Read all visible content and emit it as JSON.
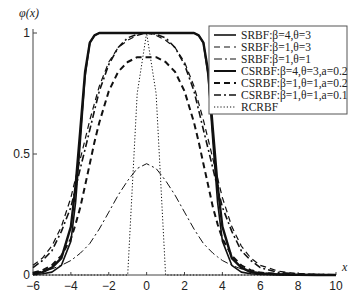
{
  "chart_data": {
    "type": "line",
    "title": "",
    "xlabel": "x",
    "ylabel": "φ(x)",
    "xlim": [
      -6,
      10
    ],
    "ylim": [
      0,
      1
    ],
    "xticks": [
      -6,
      -4,
      -2,
      0,
      2,
      4,
      6,
      8,
      10
    ],
    "xtick_labels": [
      "−6",
      "−4",
      "−2",
      "0",
      "2",
      "4",
      "6",
      "8",
      "10"
    ],
    "yticks": [
      0,
      0.5,
      1
    ],
    "ytick_labels": [
      "0",
      "0.5",
      "1"
    ],
    "grid": false,
    "legend_position": "upper right",
    "x": [
      -6,
      -5.5,
      -5,
      -4.5,
      -4,
      -3.75,
      -3.5,
      -3.25,
      -3,
      -2.75,
      -2.5,
      -2,
      -1.5,
      -1,
      -0.5,
      0,
      0.5,
      1,
      1.5,
      2,
      2.5,
      2.75,
      3,
      3.25,
      3.5,
      3.75,
      4,
      4.5,
      5,
      5.5,
      6,
      7,
      8,
      9,
      10
    ],
    "series": [
      {
        "name": "SRBF:β=4,θ=3",
        "style": "solid",
        "width": 1.6,
        "values": [
          0.002,
          0.005,
          0.012,
          0.04,
          0.14,
          0.3,
          0.55,
          0.82,
          0.96,
          0.99,
          1,
          1,
          1,
          1,
          1,
          1,
          1,
          1,
          1,
          1,
          1,
          0.99,
          0.96,
          0.82,
          0.55,
          0.3,
          0.14,
          0.04,
          0.012,
          0.005,
          0.002,
          0.001,
          0,
          0,
          0
        ]
      },
      {
        "name": "SRBF:β=1,θ=3",
        "style": "dashed",
        "width": 1.2,
        "values": [
          0.04,
          0.07,
          0.12,
          0.2,
          0.32,
          0.4,
          0.48,
          0.56,
          0.64,
          0.71,
          0.78,
          0.88,
          0.94,
          0.97,
          0.99,
          1,
          0.99,
          0.97,
          0.94,
          0.88,
          0.78,
          0.71,
          0.64,
          0.56,
          0.48,
          0.4,
          0.32,
          0.2,
          0.12,
          0.07,
          0.04,
          0.015,
          0.005,
          0.002,
          0.001
        ]
      },
      {
        "name": "SRBF:β=1,θ=1",
        "style": "dashdot",
        "width": 1.0,
        "values": [
          0.01,
          0.015,
          0.025,
          0.04,
          0.06,
          0.075,
          0.09,
          0.11,
          0.13,
          0.16,
          0.19,
          0.26,
          0.33,
          0.39,
          0.44,
          0.46,
          0.44,
          0.39,
          0.33,
          0.26,
          0.19,
          0.16,
          0.13,
          0.11,
          0.09,
          0.075,
          0.06,
          0.04,
          0.025,
          0.015,
          0.01,
          0.004,
          0.002,
          0.001,
          0
        ]
      },
      {
        "name": "CSRBF:β=4,θ=3,a=0.2",
        "style": "solid",
        "width": 2.4,
        "values": [
          0.006,
          0.012,
          0.03,
          0.07,
          0.2,
          0.37,
          0.6,
          0.84,
          0.96,
          0.99,
          1,
          1,
          1,
          1,
          1,
          1,
          1,
          1,
          1,
          1,
          1,
          0.99,
          0.96,
          0.84,
          0.6,
          0.37,
          0.2,
          0.07,
          0.03,
          0.012,
          0.006,
          0.002,
          0.001,
          0,
          0
        ]
      },
      {
        "name": "CSRBF:β=1,θ=1,a=0.2",
        "style": "dashed-thick",
        "width": 2.0,
        "values": [
          0.01,
          0.02,
          0.04,
          0.08,
          0.15,
          0.21,
          0.28,
          0.37,
          0.46,
          0.55,
          0.63,
          0.76,
          0.84,
          0.88,
          0.9,
          0.9,
          0.9,
          0.88,
          0.84,
          0.76,
          0.63,
          0.55,
          0.46,
          0.37,
          0.28,
          0.21,
          0.15,
          0.08,
          0.04,
          0.02,
          0.01,
          0.004,
          0.002,
          0.001,
          0
        ]
      },
      {
        "name": "CSRBF:β=1,θ=1,a=0.1",
        "style": "dashdot-thick",
        "width": 1.6,
        "values": [
          0.03,
          0.06,
          0.1,
          0.18,
          0.28,
          0.36,
          0.44,
          0.52,
          0.6,
          0.68,
          0.76,
          0.87,
          0.94,
          0.98,
          0.995,
          1,
          0.995,
          0.98,
          0.94,
          0.87,
          0.76,
          0.68,
          0.6,
          0.52,
          0.44,
          0.36,
          0.28,
          0.18,
          0.1,
          0.06,
          0.03,
          0.01,
          0.004,
          0.002,
          0.001
        ]
      },
      {
        "name": "RCRBF",
        "style": "dotted",
        "width": 1.0,
        "values": [
          0,
          0,
          0,
          0,
          0,
          0,
          0,
          0,
          0,
          0,
          0,
          0,
          0,
          0,
          0.75,
          1,
          0.75,
          0,
          0,
          0,
          0,
          0,
          0,
          0,
          0,
          0,
          0,
          0,
          0,
          0,
          0,
          0,
          0,
          0,
          0
        ]
      }
    ]
  }
}
